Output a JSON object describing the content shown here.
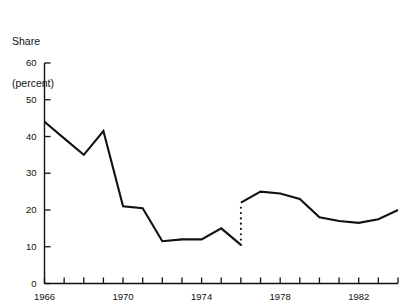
{
  "chart_data": {
    "type": "line",
    "title": "Share (percent)",
    "title_lines": [
      "Share",
      "(percent)"
    ],
    "xlabel": "",
    "ylabel": "Share (percent)",
    "xlim": [
      1966,
      1984
    ],
    "ylim": [
      0,
      60
    ],
    "yticks": [
      0,
      10,
      20,
      30,
      40,
      50,
      60
    ],
    "ytick_labels": [
      "0",
      "10",
      "20",
      "30",
      "40",
      "50",
      "60"
    ],
    "xticks": [
      1966,
      1967,
      1968,
      1969,
      1970,
      1971,
      1972,
      1973,
      1974,
      1975,
      1976,
      1977,
      1978,
      1979,
      1980,
      1981,
      1982,
      1983,
      1984
    ],
    "xtick_labels": [
      "1966",
      "1970",
      "1974",
      "1978",
      "1982"
    ],
    "xtick_labeled_years": [
      1966,
      1970,
      1974,
      1978,
      1982
    ],
    "grid": false,
    "legend": null,
    "line_color": "#111111",
    "series": [
      {
        "name": "Share",
        "segment": "pre-break",
        "x": [
          1966,
          1967,
          1968,
          1969,
          1970,
          1971,
          1972,
          1973,
          1974,
          1975,
          1976
        ],
        "values": [
          44,
          39.5,
          35,
          41.5,
          21,
          20.5,
          11.5,
          12,
          12,
          15,
          10.5
        ]
      },
      {
        "name": "Share",
        "segment": "post-break",
        "x": [
          1976,
          1977,
          1978,
          1979,
          1980,
          1981,
          1982,
          1983,
          1984
        ],
        "values": [
          22,
          25,
          24.5,
          23,
          18,
          17,
          16.5,
          17.5,
          20
        ]
      }
    ],
    "break_annotation": {
      "style": "dotted-vertical",
      "x": 1976,
      "y_from": 10.5,
      "y_to": 22
    }
  }
}
